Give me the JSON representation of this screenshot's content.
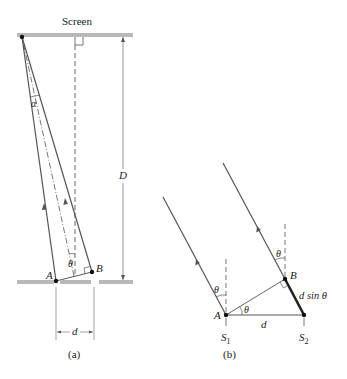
{
  "figure": {
    "panel_a": {
      "caption": "(a)",
      "screen_label": "Screen",
      "labels": {
        "alpha": "α",
        "theta": "θ",
        "point_a": "A",
        "point_b": "B",
        "distance_D": "D",
        "separation_d": "d"
      }
    },
    "panel_b": {
      "caption": "(b)",
      "labels": {
        "theta_left": "θ",
        "theta_right": "θ",
        "theta_angle": "θ",
        "point_a": "A",
        "point_b": "B",
        "separation_d": "d",
        "path_difference": "d sin θ",
        "slit_1": "S",
        "slit_1_sub": "1",
        "slit_2": "S",
        "slit_2_sub": "2"
      }
    },
    "colors": {
      "line": "#555555",
      "plate": "#b8b8b8",
      "dot": "#111111",
      "text": "#222222"
    }
  }
}
